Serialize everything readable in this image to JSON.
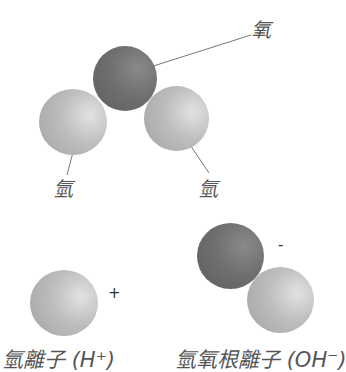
{
  "water_molecule": {
    "oxygen_label": "氧",
    "hydrogen_left_label": "氫",
    "hydrogen_right_label": "氫"
  },
  "ions": {
    "hydrogen_ion": {
      "charge": "+",
      "caption": "氫離子 (H⁺)"
    },
    "hydroxide_ion": {
      "charge": "-",
      "caption": "氫氧根離子 (OH⁻)"
    }
  },
  "colors": {
    "oxygen": "#6f6f6f",
    "hydrogen": "#bdbdbd",
    "leader_line": "#555555",
    "text": "#555555"
  }
}
